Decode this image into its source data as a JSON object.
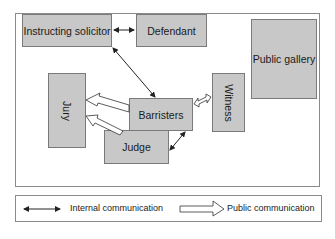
{
  "diagram": {
    "nodes": {
      "instructing_solicitor": "Instructing solicitor",
      "defendant": "Defendant",
      "public_gallery": "Public gallery",
      "jury": "Jury",
      "barristers": "Barristers",
      "witness": "Witness",
      "judge": "Judge"
    },
    "edges": [
      {
        "from": "Instructing solicitor",
        "to": "Defendant",
        "type": "internal"
      },
      {
        "from": "Instructing solicitor",
        "to": "Barristers",
        "type": "internal"
      },
      {
        "from": "Barristers",
        "to": "Jury",
        "type": "public"
      },
      {
        "from": "Judge",
        "to": "Jury",
        "type": "public"
      },
      {
        "from": "Barristers",
        "to": "Witness",
        "type": "public"
      },
      {
        "from": "Barristers",
        "to": "Judge",
        "type": "internal"
      }
    ],
    "legend": {
      "internal": "Internal communication",
      "public": "Public communication"
    }
  }
}
